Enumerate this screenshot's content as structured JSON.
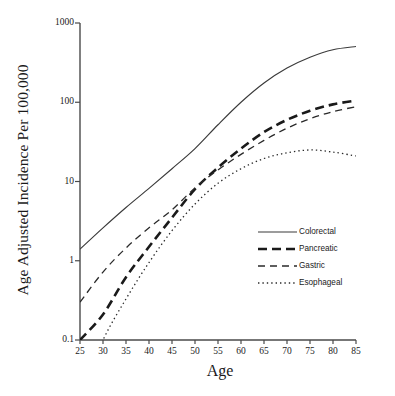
{
  "chart_data": {
    "type": "line",
    "title": "",
    "xlabel": "Age",
    "ylabel": "Age Adjusted Incidence Per 100,000",
    "yscale": "log",
    "xlim": [
      25,
      85
    ],
    "ylim": [
      0.1,
      1000
    ],
    "grid": false,
    "legend_position": "center-right",
    "xticks": [
      "25",
      "30",
      "35",
      "40",
      "45",
      "50",
      "55",
      "60",
      "65",
      "70",
      "75",
      "80",
      "85"
    ],
    "yticks": [
      "1000",
      "100",
      "10",
      "1",
      "0.1"
    ],
    "x": [
      25,
      30,
      35,
      40,
      45,
      50,
      55,
      60,
      65,
      70,
      75,
      80,
      85
    ],
    "series": [
      {
        "name": "Colorectal",
        "style": "solid",
        "color": "#3a3a3a",
        "values": [
          1.4,
          2.6,
          4.7,
          8.2,
          14.5,
          26.0,
          52.0,
          100.0,
          175.0,
          270.0,
          370.0,
          460.0,
          505.0
        ]
      },
      {
        "name": "Pancreatic",
        "style": "thick-dashed",
        "color": "#1a1a1a",
        "values": [
          0.1,
          0.21,
          0.62,
          1.5,
          3.5,
          8.0,
          15.0,
          26.0,
          42.0,
          60.0,
          78.0,
          94.0,
          105.0
        ]
      },
      {
        "name": "Gastric",
        "style": "dashed",
        "color": "#2a2a2a",
        "values": [
          0.3,
          0.72,
          1.45,
          2.6,
          4.4,
          8.3,
          14.0,
          22.0,
          33.0,
          47.0,
          62.0,
          76.0,
          88.0
        ]
      },
      {
        "name": "Esophageal",
        "style": "dotted",
        "color": "#2a2a2a",
        "values": [
          0.02,
          0.1,
          0.33,
          0.95,
          2.4,
          5.2,
          9.5,
          14.5,
          19.5,
          23.0,
          25.0,
          23.5,
          21.0
        ]
      }
    ]
  },
  "axes": {
    "y_title": "Age Adjusted Incidence Per 100,000",
    "x_title": "Age"
  },
  "legend": {
    "items": [
      {
        "label": "Colorectal"
      },
      {
        "label": "Pancreatic"
      },
      {
        "label": "Gastric"
      },
      {
        "label": "Esophageal"
      }
    ]
  }
}
